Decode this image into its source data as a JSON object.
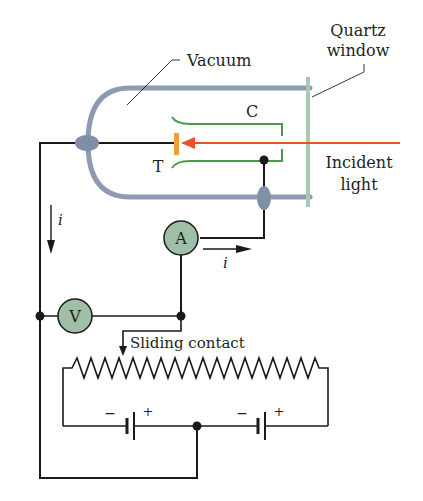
{
  "diagram": {
    "labels": {
      "quartz_line1": "Quartz",
      "quartz_line2": "window",
      "vacuum": "Vacuum",
      "collector": "C",
      "target": "T",
      "incident_line1": "Incident",
      "incident_line2": "light",
      "current_left": "i",
      "current_right": "i",
      "ammeter": "A",
      "voltmeter": "V",
      "sliding_contact": "Sliding contact",
      "battery1_minus": "−",
      "battery1_plus": "+",
      "battery2_minus": "−",
      "battery2_plus": "+"
    },
    "colors": {
      "tube": "#8c9bb0",
      "seal": "#7f8fa8",
      "window": "#a9c9b0",
      "light": "#e8502a",
      "target": "#f0a030",
      "collector": "#4c9a4c",
      "meter_fill": "#9fbfa8",
      "wire": "#1a1a1a"
    }
  }
}
